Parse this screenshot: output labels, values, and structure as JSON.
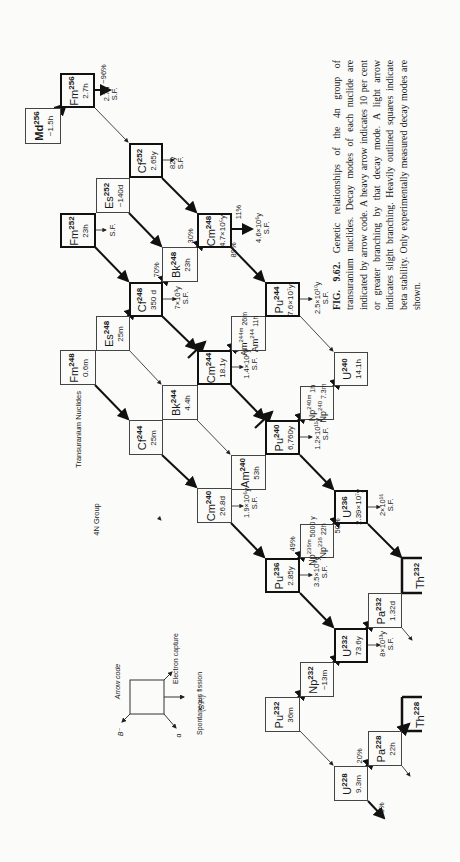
{
  "title": {
    "group": "4N Group",
    "subtitle": "Transuranium Nuclides"
  },
  "legend": {
    "heading": "Arrow code",
    "beta_minus": "B⁻",
    "alpha": "α",
    "electron_capture": "Electron capture",
    "spontaneous_fission": "Spontaneous fission",
    "sf_abbrev": "(S.F.)"
  },
  "nuclides": [
    {
      "id": "md256",
      "symbol": "Md",
      "mass": "256",
      "halflife": "~1.5h",
      "heavy": false
    },
    {
      "id": "fm256",
      "symbol": "Fm",
      "mass": "256",
      "halflife": "2.7h",
      "heavy": true
    },
    {
      "id": "cf252",
      "symbol": "Cf",
      "mass": "252",
      "halflife": "2.65y",
      "heavy": true
    },
    {
      "id": "es252",
      "symbol": "Es",
      "mass": "252",
      "halflife": "~140d",
      "heavy": false
    },
    {
      "id": "fm252",
      "symbol": "Fm",
      "mass": "252",
      "halflife": "23h",
      "heavy": true
    },
    {
      "id": "cf248",
      "symbol": "Cf",
      "mass": "248",
      "halflife": "350 d",
      "heavy": true
    },
    {
      "id": "bk248",
      "symbol": "Bk",
      "mass": "248",
      "halflife": "23h",
      "heavy": false
    },
    {
      "id": "cm248",
      "symbol": "Cm",
      "mass": "248",
      "halflife": "4.7×10⁵y",
      "heavy": true
    },
    {
      "id": "es248",
      "symbol": "Es",
      "mass": "248",
      "halflife": "25m",
      "heavy": false
    },
    {
      "id": "fm248",
      "symbol": "Fm",
      "mass": "248",
      "halflife": "0.6m",
      "heavy": false
    },
    {
      "id": "cf244",
      "symbol": "Cf",
      "mass": "244",
      "halflife": "25m",
      "heavy": false
    },
    {
      "id": "bk244",
      "symbol": "Bk",
      "mass": "244",
      "halflife": "4.4h",
      "heavy": false
    },
    {
      "id": "cm244",
      "symbol": "Cm",
      "mass": "244",
      "halflife": "18.1y",
      "heavy": true
    },
    {
      "id": "am244",
      "symbol": "Am",
      "mass": "244m",
      "halflife": "26m",
      "symbol2": "Am",
      "mass2": "244",
      "halflife2": "11h",
      "heavy": false
    },
    {
      "id": "pu244",
      "symbol": "Pu",
      "mass": "244",
      "halflife": "7.6×10⁷y",
      "heavy": true
    },
    {
      "id": "cm240",
      "symbol": "Cm",
      "mass": "240",
      "halflife": "26.8d",
      "heavy": false
    },
    {
      "id": "am240",
      "symbol": "Am",
      "mass": "240",
      "halflife": "53h",
      "heavy": false
    },
    {
      "id": "pu240",
      "symbol": "Pu",
      "mass": "240",
      "halflife": "6,760y",
      "heavy": true
    },
    {
      "id": "np240",
      "symbol": "Np",
      "mass": "240m",
      "halflife": "1h",
      "symbol2": "Np",
      "mass2": "240",
      "halflife2": "7.3m",
      "heavy": false
    },
    {
      "id": "u240",
      "symbol": "U",
      "mass": "240",
      "halflife": "14.1h",
      "heavy": false
    },
    {
      "id": "pu236",
      "symbol": "Pu",
      "mass": "236",
      "halflife": "2.85y",
      "heavy": true
    },
    {
      "id": "np236",
      "symbol": "Np",
      "mass": "236m",
      "halflife": "5000 y",
      "symbol2": "Np",
      "mass2": "236",
      "halflife2": "22h",
      "heavy": false
    },
    {
      "id": "u236",
      "symbol": "U",
      "mass": "236",
      "halflife": "2.39×10⁷y",
      "heavy": true
    },
    {
      "id": "th232",
      "symbol": "Th",
      "mass": "232",
      "halflife": "",
      "heavy": true
    },
    {
      "id": "pa232",
      "symbol": "Pa",
      "mass": "232",
      "halflife": "1.32d",
      "heavy": false
    },
    {
      "id": "u232",
      "symbol": "U",
      "mass": "232",
      "halflife": "73.6y",
      "heavy": true
    },
    {
      "id": "np232",
      "symbol": "Np",
      "mass": "232",
      "halflife": "~13m",
      "heavy": false
    },
    {
      "id": "pu232",
      "symbol": "Pu",
      "mass": "232",
      "halflife": "36m",
      "heavy": false
    },
    {
      "id": "u228",
      "symbol": "U",
      "mass": "228",
      "halflife": "9.3m",
      "heavy": false
    },
    {
      "id": "pa228",
      "symbol": "Pa",
      "mass": "228",
      "halflife": "22h",
      "heavy": false
    },
    {
      "id": "th228",
      "symbol": "Th",
      "mass": "228",
      "halflife": "",
      "heavy": true
    }
  ],
  "annotations": {
    "fm256_branch": "~96%",
    "fm256_sf": "2.7h",
    "fm256_sf_label": "S.F.",
    "cf252_sf": "82y",
    "cf252_sf_label": "S.F.",
    "fm252_sf_label": "S.F.",
    "cf248_sf": "7×10³y",
    "cf248_sf_label": "S.F.",
    "cf248_branch": "70%",
    "bk248_branch": "30%",
    "cm248_sf_branch": "11%",
    "cm248_alpha_branch": "89%",
    "cm248_sf": "4.6×10⁶y",
    "cm248_sf_label": "S.F.",
    "pu244_sf": "2.5×10¹⁰y",
    "pu244_sf_label": "S.F.",
    "cm244_sf": "1.4×10⁷y",
    "cm244_sf_label": "S.F.",
    "cm240_sf": "1.9×10⁶y",
    "cm240_sf_label": "S.F.",
    "pu240_sf": "1.2×10¹¹y",
    "pu240_sf_label": "S.F.",
    "pu236_branch": "49%",
    "pu236_sf": "3.5×10⁹y",
    "pu236_sf_label": "S.F.",
    "u236_branch": "50%",
    "u236_sf": "2×10¹⁶",
    "u236_sf_label": "S.F.",
    "u232_sf": "8×10¹³y",
    "u232_sf_label": "S.F.",
    "u228_ec_branch": "20%",
    "u228_alpha_branch": "80%"
  },
  "caption": {
    "fig": "FIG. 9.62.",
    "text": "Genetic relationships of the 4n group of transuranium nuclides. Decay modes of each nuclide are indicated by arrow code. A heavy arrow indicates 10 per cent or greater branching by that decay mode. A light arrow indicates slight branching. Heavily outlined squares indicate beta stability. Only experimentally measured decay modes are shown."
  }
}
